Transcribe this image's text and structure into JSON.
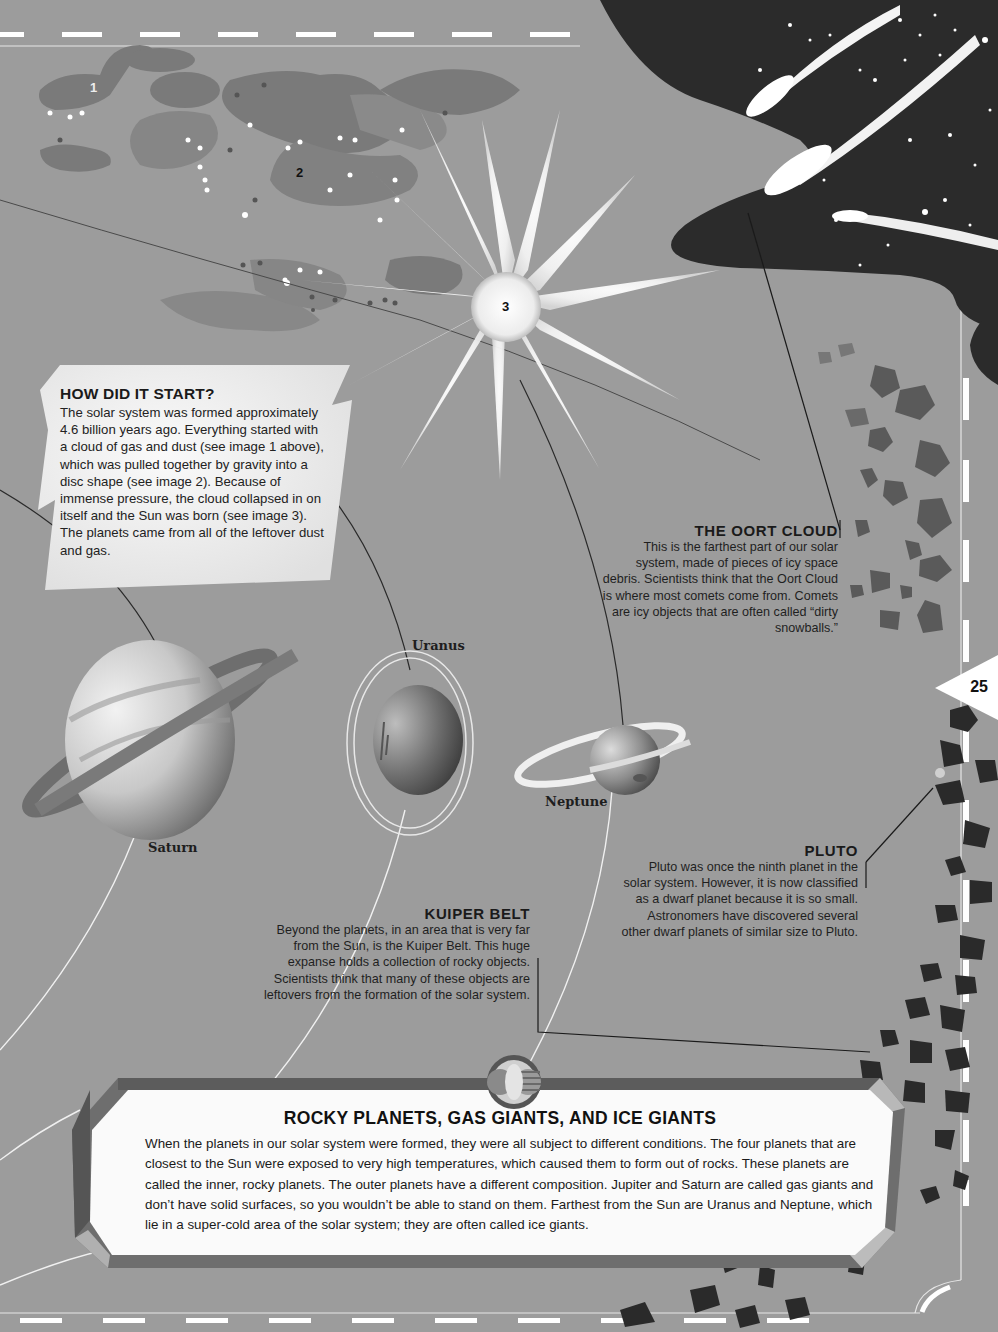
{
  "page": {
    "page_number": "25",
    "colors": {
      "background": "#9c9c9c",
      "space_dark": "#2a2a2a",
      "cloud_gray": "#777777",
      "panel_white": "#fafafa",
      "text": "#1a1a1a"
    }
  },
  "illustration": {
    "stage_labels": [
      "1",
      "2",
      "3"
    ],
    "icons": [
      "gas-cloud-illustration",
      "disc-swirl-illustration",
      "sun-star-illustration",
      "comets-illustration",
      "oort-cloud-debris",
      "kuiper-belt-rocks"
    ]
  },
  "how_did_it_start": {
    "title": "HOW DID IT START?",
    "body": "The solar system was formed approximately 4.6 billion years ago. Everything started with a cloud of gas and dust (see image 1 above), which was pulled together by gravity into a disc shape (see image 2). Because of immense pressure, the cloud collapsed in on itself and the Sun was born (see image 3). The planets came from all of the leftover dust and gas."
  },
  "oort_cloud": {
    "title": "THE OORT CLOUD",
    "body": "This is the farthest part of our solar system, made of pieces of icy space debris. Scientists think that the Oort Cloud is where most comets come from. Comets are icy objects that are often called “dirty snowballs.”"
  },
  "planets": {
    "saturn": "Saturn",
    "uranus": "Uranus",
    "neptune": "Neptune"
  },
  "pluto": {
    "title": "PLUTO",
    "body": "Pluto was once the ninth planet in the solar system. However, it is now classified as a dwarf planet because it is so small. Astronomers have discovered several other dwarf planets of similar size to Pluto."
  },
  "kuiper_belt": {
    "title": "KUIPER BELT",
    "body": "Beyond the planets, in an area that is very far from the Sun, is the Kuiper Belt. This huge expanse holds a collection of rocky objects. Scientists think that many of these objects are leftovers from the formation of the solar system."
  },
  "panel": {
    "title": "ROCKY PLANETS, GAS GIANTS, AND ICE GIANTS",
    "body": "When the planets in our solar system were formed, they were all subject to different conditions. The four planets that are closest to the Sun were exposed to very high temperatures, which caused them to form out of rocks. These planets are called the inner, rocky planets. The outer planets have a different composition. Jupiter and Saturn are called gas giants and don’t have solid surfaces, so you wouldn’t be able to stand on them. Farthest from the Sun are Uranus and Neptune, which lie in a super-cold area of the solar system; they are often called ice giants."
  }
}
